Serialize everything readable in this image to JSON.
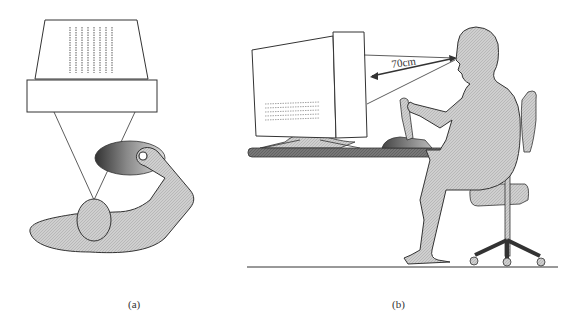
{
  "figure": {
    "panel_a": {
      "caption": "(a)",
      "description": "Top-down view: overhead display/projector above subject, subject's head and arm reaching a mouse/joystick on a pad"
    },
    "panel_b": {
      "caption": "(b)",
      "description": "Side view: seated subject at desk facing CRT monitor, using joystick",
      "distance_label": "70cm"
    }
  },
  "colors": {
    "line": "#333333",
    "fill_gray": "#c8c8c8",
    "desk": "#6e6e6e",
    "background": "#ffffff"
  }
}
